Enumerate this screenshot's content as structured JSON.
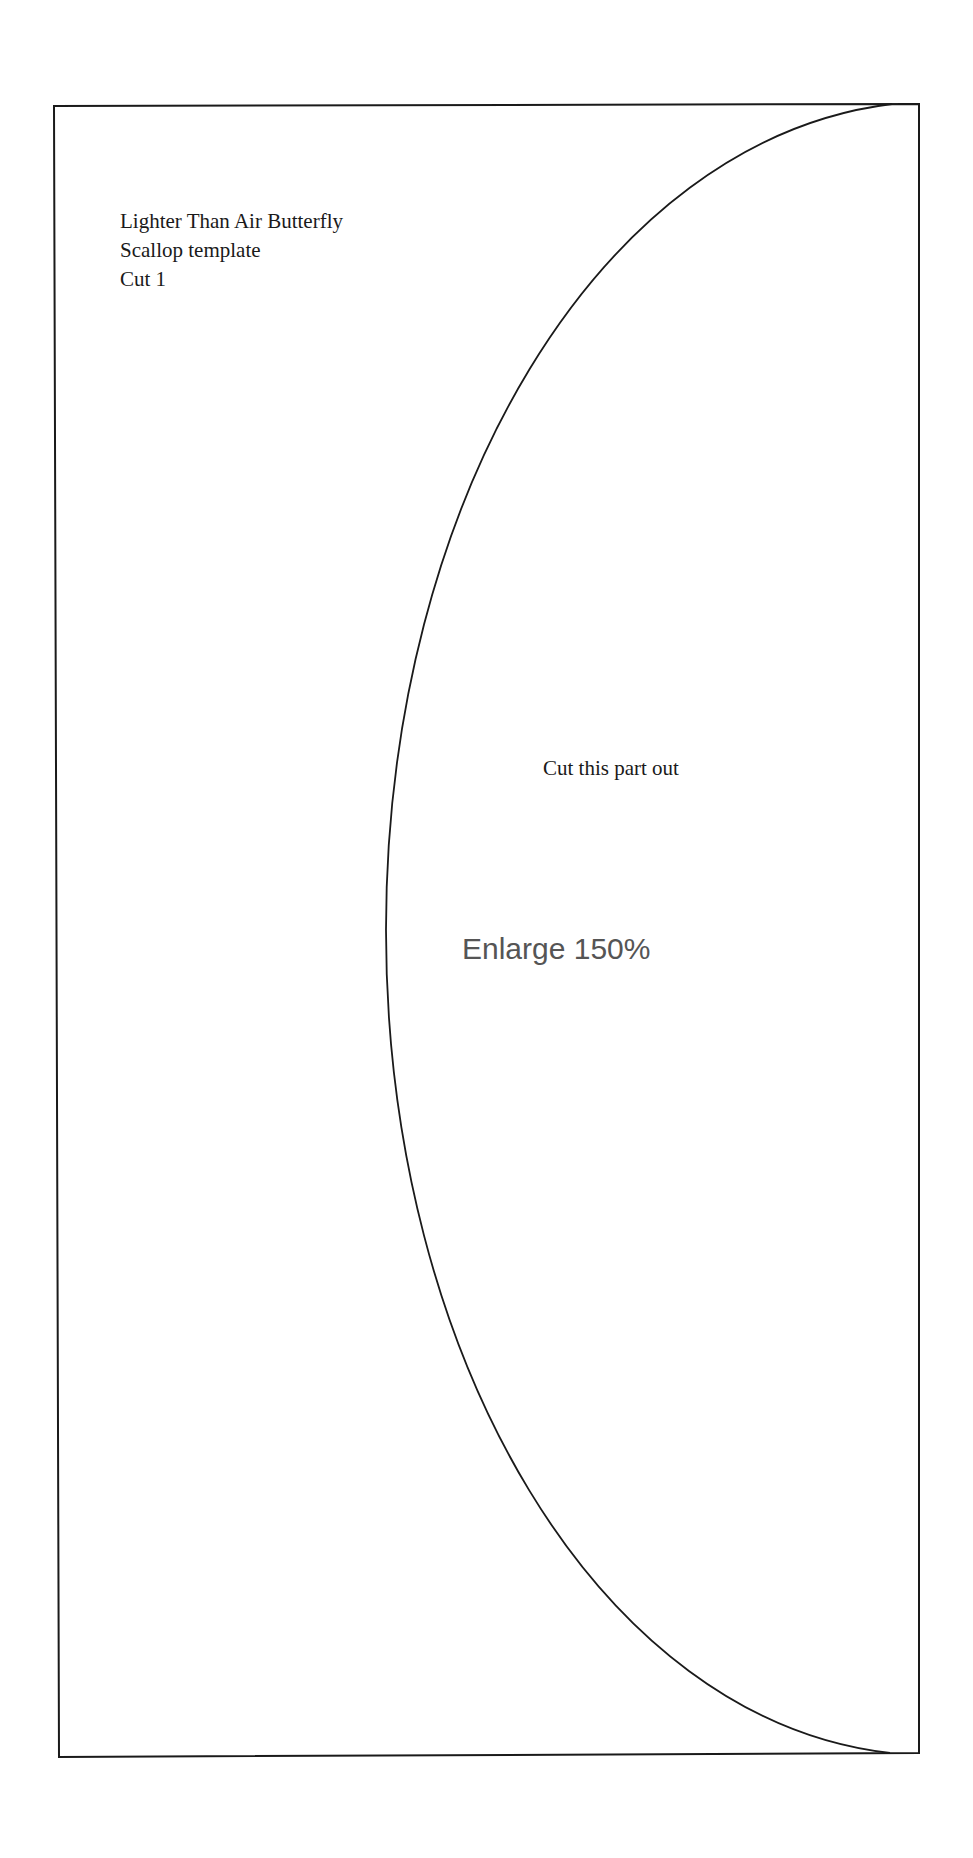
{
  "document": {
    "title_lines": [
      "Lighter Than Air Butterfly",
      "Scallop template",
      "Cut 1"
    ],
    "cut_instruction": "Cut this part out",
    "enlarge_instruction": "Enlarge 150%"
  },
  "colors": {
    "line": "#1a1a1a",
    "enlarge_text": "#555555",
    "background": "#ffffff"
  }
}
